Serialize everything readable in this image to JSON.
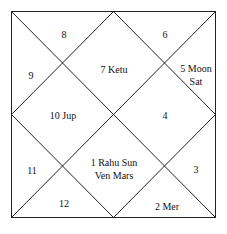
{
  "chart": {
    "style": "North Indian",
    "line_color": "#222222",
    "houses": [
      {
        "sign": "1",
        "planets": [
          "Rahu",
          "Sun",
          "Ven",
          "Mars"
        ],
        "lines": [
          "1 Rahu Sun",
          "Ven Mars"
        ],
        "x": 114,
        "y": 169
      },
      {
        "sign": "2",
        "planets": [
          "Mer"
        ],
        "lines": [
          "2 Mer"
        ],
        "x": 167,
        "y": 206
      },
      {
        "sign": "3",
        "planets": [],
        "lines": [
          "3"
        ],
        "x": 196,
        "y": 169
      },
      {
        "sign": "4",
        "planets": [],
        "lines": [
          "4"
        ],
        "x": 165,
        "y": 115
      },
      {
        "sign": "5",
        "planets": [
          "Moon",
          "Sat"
        ],
        "lines": [
          "5 Moon",
          "Sat"
        ],
        "x": 196,
        "y": 75
      },
      {
        "sign": "6",
        "planets": [],
        "lines": [
          "6"
        ],
        "x": 165,
        "y": 34
      },
      {
        "sign": "7",
        "planets": [
          "Ketu"
        ],
        "lines": [
          "7 Ketu"
        ],
        "x": 114,
        "y": 69
      },
      {
        "sign": "8",
        "planets": [],
        "lines": [
          "8"
        ],
        "x": 64,
        "y": 34
      },
      {
        "sign": "9",
        "planets": [],
        "lines": [
          "9"
        ],
        "x": 31,
        "y": 75
      },
      {
        "sign": "10",
        "planets": [
          "Jup"
        ],
        "lines": [
          "10 Jup"
        ],
        "x": 63,
        "y": 115
      },
      {
        "sign": "11",
        "planets": [],
        "lines": [
          "11"
        ],
        "x": 32,
        "y": 170
      },
      {
        "sign": "12",
        "planets": [],
        "lines": [
          "12"
        ],
        "x": 64,
        "y": 203
      }
    ]
  }
}
